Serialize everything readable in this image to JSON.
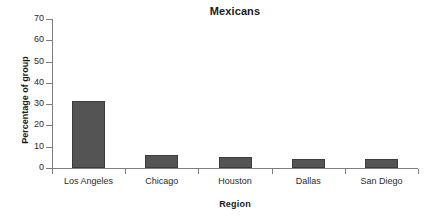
{
  "chart_data": {
    "type": "bar",
    "title": "Mexicans",
    "xlabel": "Region",
    "ylabel": "Percentage of group",
    "categories": [
      "Los Angeles",
      "Chicago",
      "Houston",
      "Dallas",
      "San Diego"
    ],
    "values": [
      31.5,
      6.1,
      5.0,
      4.4,
      4.3
    ],
    "ylim": [
      0,
      70
    ],
    "ytick_labels": [
      "0",
      "10",
      "20",
      "30",
      "40",
      "50",
      "60",
      "70"
    ],
    "ytick_values": [
      0,
      10,
      20,
      30,
      40,
      50,
      60,
      70
    ],
    "grid": false,
    "legend": false,
    "bar_color": "#545454",
    "bar_edge_color": "#3c3c3c",
    "axis_color": "#7d7d7d",
    "text_color": "#1a1a1a",
    "background": "#ffffff"
  }
}
